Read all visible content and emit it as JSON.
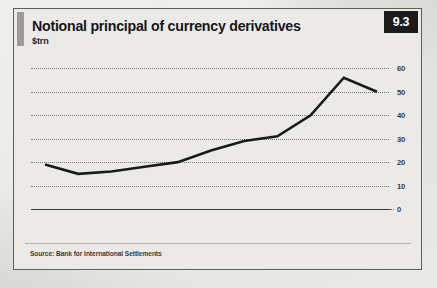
{
  "card": {
    "badge": "9.3",
    "title": "Notional principal of currency derivatives",
    "subtitle": "$trn",
    "source": "Source: Bank for International Settlements"
  },
  "colors": {
    "badge_background": "#1b1b1d",
    "badge_text": "#ffffff",
    "card_background": "#eceae6",
    "card_border": "#5d5d5b",
    "title_accent": "#9c9b98",
    "line": "#1a1a1c",
    "gridline": "#77766f",
    "axis": "#3c3c3e",
    "tick_text": "#3a3a3c",
    "page_background": "#d9d8d4"
  },
  "chart_data": {
    "type": "line",
    "title": "Notional principal of currency derivatives",
    "subtitle": "$trn",
    "xlabel": "",
    "ylabel": "$trn",
    "categories": [
      "1998",
      "1999",
      "2000",
      "2001",
      "2002",
      "2003",
      "2004",
      "2005",
      "2006",
      "2007",
      "2008"
    ],
    "x": [
      1998,
      1999,
      2000,
      2001,
      2002,
      2003,
      2004,
      2005,
      2006,
      2007,
      2008
    ],
    "values": [
      19,
      15,
      16,
      18,
      20,
      25,
      29,
      31,
      40,
      56,
      50
    ],
    "series": [
      {
        "name": "Notional principal of currency derivatives",
        "values": [
          19,
          15,
          16,
          18,
          20,
          25,
          29,
          31,
          40,
          56,
          50
        ]
      }
    ],
    "ylim": [
      0,
      64
    ],
    "yticks": [
      0,
      10,
      20,
      30,
      40,
      50,
      60
    ],
    "ytick_labels": [
      "0",
      "10",
      "20",
      "30",
      "40",
      "50",
      "60"
    ],
    "xlim": [
      1998,
      2008
    ],
    "grid": "horizontal-dotted",
    "y_axis_position": "right",
    "legend": "none",
    "source": "Source: Bank for International Settlements"
  }
}
